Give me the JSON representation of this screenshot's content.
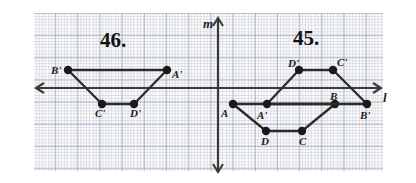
{
  "figure": {
    "type": "geometry-diagram",
    "canvas": {
      "width": 416,
      "height": 183
    },
    "grid": {
      "left": 33,
      "top": 13,
      "width": 350,
      "height": 158,
      "major_spacing_px": 22.2,
      "minor_spacing_px": 11.1,
      "visible": true
    }
  },
  "axes": {
    "horizontal": {
      "label": "l",
      "y_px": 88,
      "x_start_px": 36,
      "x_end_px": 381,
      "arrows": "both"
    },
    "vertical": {
      "label": "m",
      "x_px": 218,
      "y_start_px": 18,
      "y_end_px": 172,
      "arrows": "both"
    }
  },
  "axis_labels": [
    {
      "name": "l-axis-label",
      "text": "l",
      "x": 383,
      "y": 90
    },
    {
      "name": "m-axis-label",
      "text": "m",
      "x": 203,
      "y": 16
    }
  ],
  "problem_numbers": [
    {
      "name": "problem-46-number",
      "text": "46.",
      "x": 100,
      "y": 28
    },
    {
      "name": "problem-45-number",
      "text": "45.",
      "x": 293,
      "y": 26
    }
  ],
  "figure_46": {
    "title": "46.",
    "polygon_name": "A'B'C'D' (image quadrilateral, left of line m)",
    "closed": true,
    "vertices": [
      {
        "id": "B'",
        "label": "B'",
        "x": 68,
        "y": 70,
        "label_x": 51,
        "label_y": 64
      },
      {
        "id": "A'",
        "label": "A'",
        "x": 167,
        "y": 70,
        "label_x": 172,
        "label_y": 68
      },
      {
        "id": "D'",
        "label": "D'",
        "x": 134,
        "y": 104,
        "label_x": 130,
        "label_y": 107
      },
      {
        "id": "C'",
        "label": "C'",
        "x": 102,
        "y": 104,
        "label_x": 95,
        "label_y": 107
      }
    ],
    "edges": [
      [
        "B'",
        "A'"
      ],
      [
        "A'",
        "D'"
      ],
      [
        "D'",
        "C'"
      ],
      [
        "C'",
        "B'"
      ]
    ]
  },
  "figure_45": {
    "title": "45.",
    "polygons": [
      {
        "polygon_name": "ABCD (pre-image quadrilateral, below line l)",
        "closed": true,
        "vertices": [
          {
            "id": "A",
            "label": "A",
            "x": 233,
            "y": 104,
            "label_x": 221,
            "label_y": 107
          },
          {
            "id": "B",
            "label": "B",
            "x": 335,
            "y": 104,
            "label_x": 330,
            "label_y": 90
          },
          {
            "id": "C",
            "label": "C",
            "x": 302,
            "y": 131,
            "label_x": 299,
            "label_y": 135
          },
          {
            "id": "D",
            "label": "D",
            "x": 266,
            "y": 131,
            "label_x": 261,
            "label_y": 135
          }
        ],
        "edges": [
          [
            "A",
            "B"
          ],
          [
            "B",
            "C"
          ],
          [
            "C",
            "D"
          ],
          [
            "D",
            "A"
          ]
        ]
      },
      {
        "polygon_name": "A'B'C'D' (image quadrilateral, reflected across line l)",
        "closed": true,
        "vertices": [
          {
            "id": "A'",
            "label": "A'",
            "x": 267,
            "y": 104,
            "label_x": 257,
            "label_y": 109
          },
          {
            "id": "B'",
            "label": "B'",
            "x": 367,
            "y": 104,
            "label_x": 360,
            "label_y": 109
          },
          {
            "id": "C'",
            "label": "C'",
            "x": 333,
            "y": 70,
            "label_x": 337,
            "label_y": 56
          },
          {
            "id": "D'",
            "label": "D'",
            "x": 299,
            "y": 70,
            "label_x": 288,
            "label_y": 57
          }
        ],
        "edges": [
          [
            "A'",
            "B'"
          ],
          [
            "B'",
            "C'"
          ],
          [
            "C'",
            "D'"
          ],
          [
            "D'",
            "A'"
          ]
        ]
      }
    ]
  },
  "colors": {
    "ink": "#1b1b1b",
    "axis": "#3a3a3a",
    "grid_major": "#7882 96",
    "paper": "#ffffff"
  }
}
